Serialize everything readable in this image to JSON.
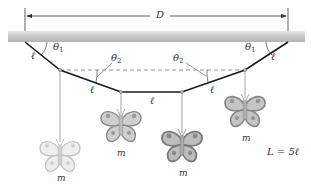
{
  "diagram": {
    "labels": {
      "distance": "D",
      "theta1_left": "θ",
      "theta1_left_sub": "1",
      "theta1_right": "θ",
      "theta1_right_sub": "1",
      "theta2_left": "θ",
      "theta2_left_sub": "2",
      "theta2_right": "θ",
      "theta2_right_sub": "2",
      "segment_1": "ℓ",
      "segment_2": "ℓ",
      "segment_3": "ℓ",
      "segment_4": "ℓ",
      "segment_5": "ℓ",
      "mass_1": "m",
      "mass_2": "m",
      "mass_3": "m",
      "mass_4": "m",
      "total_length": "L = 5ℓ"
    },
    "colors": {
      "ceiling": "#c8c8c8",
      "string": "#1a1a1a",
      "hanger": "#9a9a9a",
      "dashed": "#777777",
      "butterfly_light": "#d9d9d9",
      "butterfly_mid": "#a8a8a8",
      "butterfly_dark": "#8f8f8f"
    }
  }
}
